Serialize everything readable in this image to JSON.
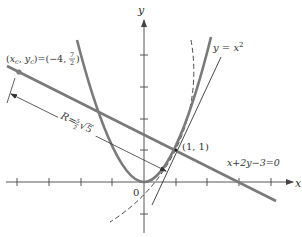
{
  "figure": {
    "type": "diagram",
    "colors": {
      "thick_curve": "#7a7a7a",
      "thin_line": "#333333",
      "axis": "#444444",
      "background": "#ffffff"
    }
  },
  "axes": {
    "x_label": "x",
    "y_label": "y",
    "origin_label": "0",
    "x_ticks": [
      -4,
      -3,
      -2,
      -1,
      1,
      2,
      3,
      4
    ],
    "y_ticks": [
      -1,
      1,
      2,
      3,
      4
    ]
  },
  "curves": {
    "parabola": {
      "label": "y = x²",
      "label_main": "y = x",
      "label_sup": "2",
      "equation": "y = x^2"
    },
    "normal_line": {
      "label": "x+2y−3=0",
      "equation": "x + 2y - 3 = 0"
    },
    "tangent_line": {
      "equation": "y = 2x - 1"
    },
    "osculating_circle": {
      "style": "dashed",
      "center": [
        -4,
        3.5
      ],
      "radius": 5.59
    }
  },
  "annotations": {
    "center_label": "(xc, yc) = (−4, 7/2)",
    "center_label_parts": {
      "lhs_open": "(",
      "x": "x",
      "x_sub": "c",
      "comma": ", ",
      "y": "y",
      "y_sub": "c",
      "eq": ")=(−4, ",
      "frac_num": "7",
      "frac_den": "2",
      "close": ")"
    },
    "point_label": "(1, 1)",
    "radius_label": "R = (5/2)√5",
    "radius_label_parts": {
      "R": "R",
      "eq": "=",
      "frac_num": "5",
      "frac_den": "2",
      "sqrt": "√",
      "radicand": "5"
    }
  }
}
